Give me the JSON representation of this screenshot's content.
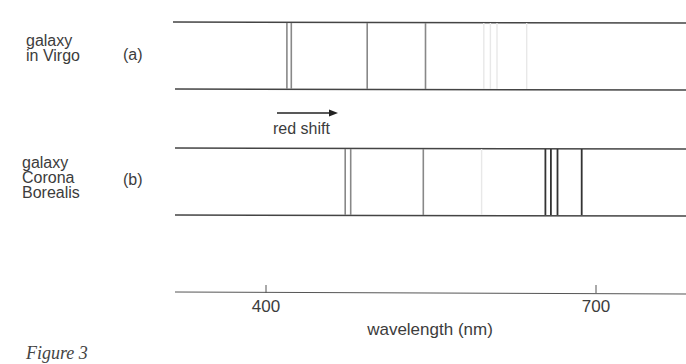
{
  "figure": {
    "caption": "Figure 3",
    "spectra": [
      {
        "id": "a",
        "label_lines": [
          "galaxy",
          "in Virgo"
        ],
        "tag": "(a)",
        "lines": [
          {
            "wavelength_nm": 419,
            "strength": "medium"
          },
          {
            "wavelength_nm": 423,
            "strength": "medium"
          },
          {
            "wavelength_nm": 492,
            "strength": "medium"
          },
          {
            "wavelength_nm": 545,
            "strength": "medium"
          },
          {
            "wavelength_nm": 598,
            "strength": "faint"
          },
          {
            "wavelength_nm": 604,
            "strength": "faint"
          },
          {
            "wavelength_nm": 610,
            "strength": "faint"
          },
          {
            "wavelength_nm": 637,
            "strength": "faint"
          }
        ]
      },
      {
        "id": "b",
        "label_lines": [
          "galaxy",
          "Corona",
          "Borealis"
        ],
        "tag": "(b)",
        "lines": [
          {
            "wavelength_nm": 472,
            "strength": "medium"
          },
          {
            "wavelength_nm": 477,
            "strength": "medium"
          },
          {
            "wavelength_nm": 543,
            "strength": "medium"
          },
          {
            "wavelength_nm": 596,
            "strength": "faint"
          },
          {
            "wavelength_nm": 654,
            "strength": "strong"
          },
          {
            "wavelength_nm": 659,
            "strength": "strong"
          },
          {
            "wavelength_nm": 665,
            "strength": "strong"
          },
          {
            "wavelength_nm": 687,
            "strength": "strong"
          }
        ]
      }
    ],
    "annotation": {
      "text": "red shift",
      "direction": "right"
    },
    "axis": {
      "label": "wavelength (nm)",
      "ticks": [
        {
          "value": 400,
          "label": "400"
        },
        {
          "value": 700,
          "label": "700"
        }
      ],
      "range_nm": [
        305,
        780
      ]
    }
  }
}
